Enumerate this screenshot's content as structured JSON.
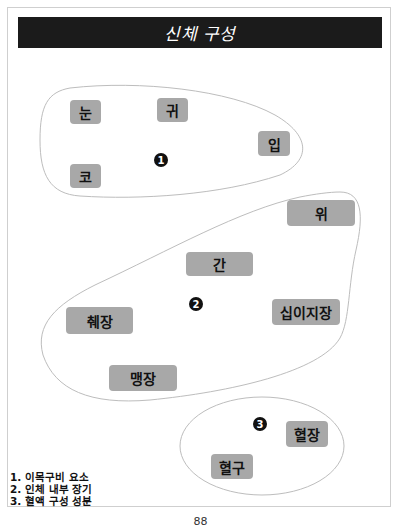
{
  "header": {
    "title": "신체 구성"
  },
  "groups": [
    {
      "marker": "1",
      "items": [
        "눈",
        "귀",
        "코",
        "입"
      ]
    },
    {
      "marker": "2",
      "items": [
        "위",
        "간",
        "췌장",
        "십이지장",
        "맹장"
      ]
    },
    {
      "marker": "3",
      "items": [
        "혈장",
        "혈구"
      ]
    }
  ],
  "legend": [
    "1. 이목구비 요소",
    "2. 인체 내부 장기",
    "3. 혈액 구성 성분"
  ],
  "page_number": "88",
  "colors": {
    "title_bar": "#1b1b1b",
    "tag_fill": "#a8a8a8",
    "outline": "#bdbdbd"
  }
}
